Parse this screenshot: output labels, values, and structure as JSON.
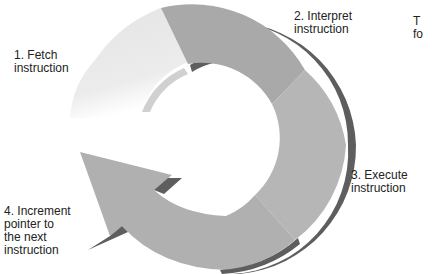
{
  "diagram": {
    "type": "cycle",
    "steps": [
      {
        "number": 1,
        "label": "1. Fetch\ninstruction",
        "color": "#e6e6e6"
      },
      {
        "number": 2,
        "label": "2. Interpret\ninstruction",
        "color": "#a9a9a9"
      },
      {
        "number": 3,
        "label": "3. Execute\ninstruction",
        "color": "#b6b6b6"
      },
      {
        "number": 4,
        "label": "4. Increment\npointer to\nthe next\ninstruction",
        "color": "#b0b0b0"
      }
    ],
    "shadow_color": "#5e5e5e",
    "cropped_text": "T\nfo"
  }
}
